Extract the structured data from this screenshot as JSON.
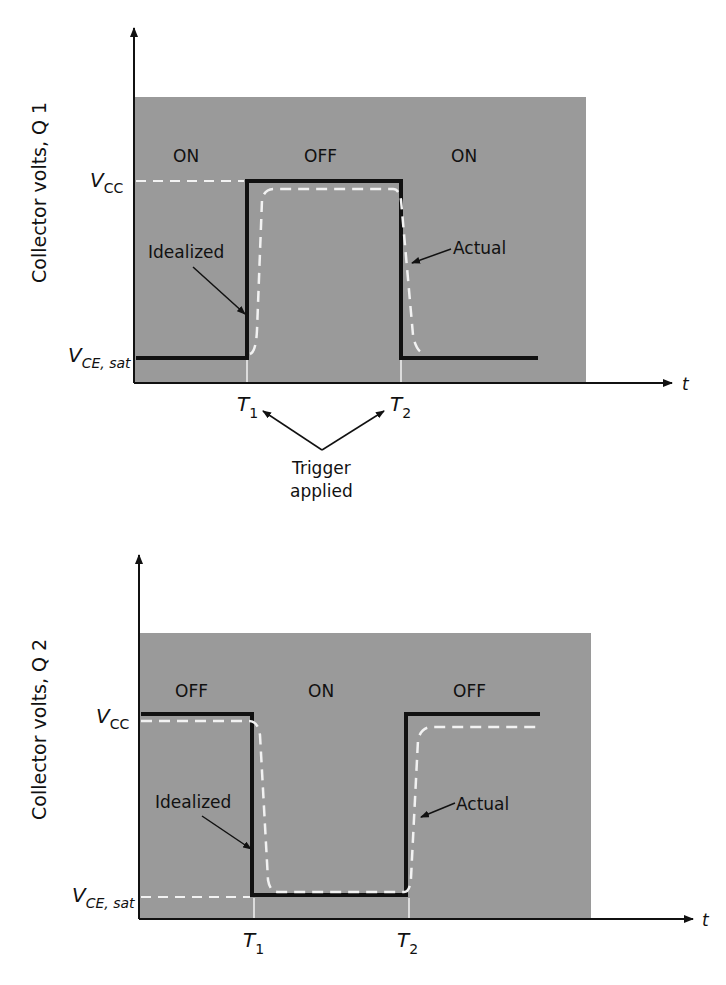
{
  "colors": {
    "panel_fill": "#9a9a9a",
    "idealized_line": "#111111",
    "actual_line": "#f2f2f2",
    "axis": "#111111",
    "background": "#ffffff"
  },
  "top_diagram": {
    "ylabel": "Collector volts, Q 1",
    "xlabel": "t",
    "states": [
      "ON",
      "OFF",
      "ON"
    ],
    "level_high": {
      "main": "V",
      "sub": "CC"
    },
    "level_low": {
      "main": "V",
      "sub": "CE, sat"
    },
    "idealized_label": "Idealized",
    "actual_label": "Actual",
    "t1": {
      "main": "T",
      "sub": "1"
    },
    "t2": {
      "main": "T",
      "sub": "2"
    },
    "trigger_line1": "Trigger",
    "trigger_line2": "applied"
  },
  "bottom_diagram": {
    "ylabel": "Collector volts, Q 2",
    "xlabel": "t",
    "states": [
      "OFF",
      "ON",
      "OFF"
    ],
    "level_high": {
      "main": "V",
      "sub": "CC"
    },
    "level_low": {
      "main": "V",
      "sub": "CE, sat"
    },
    "idealized_label": "Idealized",
    "actual_label": "Actual",
    "t1": {
      "main": "T",
      "sub": "1"
    },
    "t2": {
      "main": "T",
      "sub": "2"
    }
  }
}
